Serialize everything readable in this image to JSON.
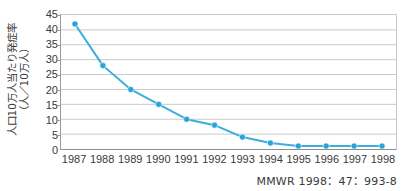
{
  "chart_data": {
    "type": "line",
    "title": "",
    "xlabel": "",
    "ylabel_line1": "人口10万人当たり発症率",
    "ylabel_line2": "（人／10万人）",
    "categories": [
      "1987",
      "1988",
      "1989",
      "1990",
      "1991",
      "1992",
      "1993",
      "1994",
      "1995",
      "1996",
      "1997",
      "1998"
    ],
    "values": [
      42,
      28,
      20,
      15,
      10,
      8,
      4,
      2,
      1,
      1,
      1,
      1
    ],
    "series": [
      {
        "name": "incidence-rate",
        "values": [
          42,
          28,
          20,
          15,
          10,
          8,
          4,
          2,
          1,
          1,
          1,
          1
        ]
      }
    ],
    "ylim": [
      0,
      45
    ],
    "yticks": [
      0,
      5,
      10,
      15,
      20,
      25,
      30,
      35,
      40,
      45
    ],
    "ytick_labels": [
      "0",
      "5",
      "10",
      "15",
      "20",
      "25",
      "30",
      "35",
      "40",
      "45"
    ],
    "grid": "horizontal",
    "legend": "none",
    "line_color": "#3aaedd",
    "marker_color": "#29a4d6",
    "grid_color": "#c9c9c9",
    "axis_color": "#8f8f8f"
  },
  "caption": {
    "source": "MMWR 1998：47：993-8"
  }
}
